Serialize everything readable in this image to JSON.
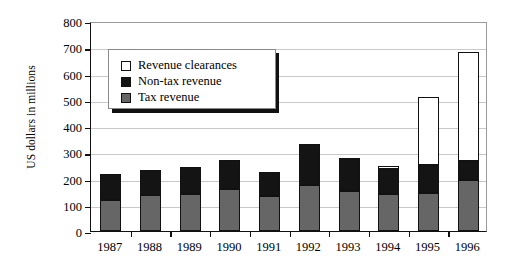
{
  "chart_data": {
    "type": "bar",
    "stacked": true,
    "title": "",
    "xlabel": "",
    "ylabel": "US dollars in millions",
    "ylim": [
      0,
      800
    ],
    "yticks": [
      0,
      100,
      200,
      300,
      400,
      500,
      600,
      700,
      800
    ],
    "grid": true,
    "legend_position": "inside-top-left",
    "categories": [
      "1987",
      "1988",
      "1989",
      "1990",
      "1991",
      "1992",
      "1993",
      "1994",
      "1995",
      "1996"
    ],
    "series": [
      {
        "name": "Tax revenue",
        "color": "#666666",
        "values": [
          120,
          137,
          140,
          160,
          133,
          175,
          152,
          140,
          145,
          195
        ]
      },
      {
        "name": "Non-tax revenue",
        "color": "#141414",
        "values": [
          98,
          95,
          102,
          112,
          92,
          155,
          128,
          95,
          105,
          70
        ]
      },
      {
        "name": "Revenue clearances",
        "color": "#ffffff",
        "values": [
          0,
          0,
          0,
          0,
          0,
          0,
          0,
          13,
          260,
          418
        ]
      }
    ],
    "totals": [
      218,
      232,
      242,
      272,
      225,
      330,
      280,
      248,
      510,
      683
    ]
  },
  "legend": {
    "items": [
      {
        "label": "Revenue clearances",
        "swatch": "white-square"
      },
      {
        "label": "Non-tax revenue",
        "swatch": "black-square"
      },
      {
        "label": "Tax revenue",
        "swatch": "gray-square"
      }
    ]
  }
}
